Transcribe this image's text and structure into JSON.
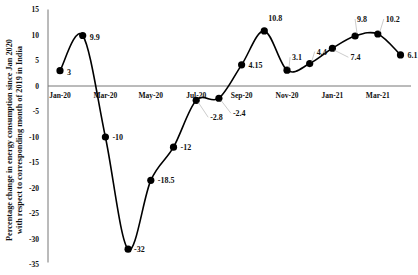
{
  "chart_data": {
    "type": "line",
    "title": "",
    "xlabel": "",
    "ylabel_lines": [
      "Percentage change in energy consumption since Jan 2020",
      "with respect to corresponding month of 2019 in India"
    ],
    "ylim": [
      -35,
      15
    ],
    "yticks": [
      15,
      10,
      5,
      0,
      -5,
      -10,
      -15,
      -20,
      -25,
      -30,
      -35
    ],
    "x": [
      "Jan-20",
      "Feb-20",
      "Mar-20",
      "Apr-20",
      "May-20",
      "Jun-20",
      "Jul-20",
      "Aug-20",
      "Sep-20",
      "Oct-20",
      "Nov-20",
      "Dec-20",
      "Jan-21",
      "Feb-21",
      "Mar-21",
      "Apr-21"
    ],
    "xtick_labels": [
      "Jan-20",
      "Mar-20",
      "May-20",
      "Jul-20",
      "Sep-20",
      "Nov-20",
      "Jan-21",
      "Mar-21"
    ],
    "series": [
      {
        "name": "Energy consumption change (%)",
        "values": [
          3,
          9.9,
          -10,
          -32,
          -18.5,
          -12,
          -2.8,
          -2.4,
          4.15,
          10.8,
          3.1,
          4.4,
          7.4,
          9.8,
          10.2,
          6.1
        ],
        "labels": [
          "3",
          "9.9",
          "-10",
          "-32",
          "-18.5",
          "-12",
          "-2.8",
          "-2.4",
          "4.15",
          "10.8",
          "3.1",
          "4.4",
          "7.4",
          "9.8",
          "10.2",
          "6.1"
        ]
      }
    ],
    "grid": false,
    "legend": false,
    "style": {
      "line_color": "#000000",
      "marker": "filled-circle",
      "smooth": true
    }
  }
}
